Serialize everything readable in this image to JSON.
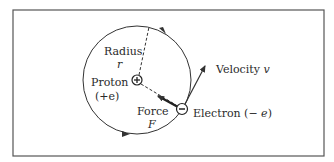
{
  "labels": {
    "radius": "Radius",
    "radius_symbol": "r",
    "proton": "Proton",
    "proton_charge": "(+e)",
    "force": "Force",
    "force_symbol": "F",
    "velocity": "Velocity",
    "velocity_symbol": "v",
    "electron": "Electron (−",
    "electron_symbol": "e",
    "electron_close": ")"
  },
  "symbols": {
    "proton": "+",
    "electron": "−"
  },
  "colors": {
    "frame": "#555555",
    "line": "#333333",
    "text": "#2a2a2a"
  }
}
